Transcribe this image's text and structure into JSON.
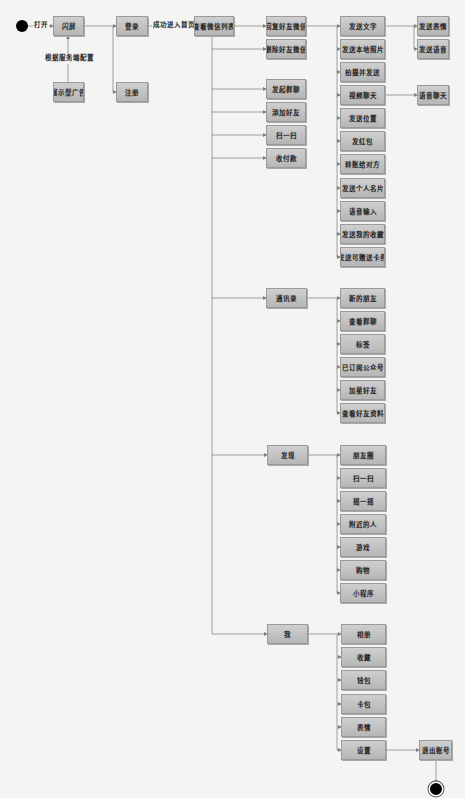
{
  "diagram": {
    "type": "activity-flow",
    "colors": {
      "node_fill_top": "#cfcfcf",
      "node_fill_bottom": "#b6b6b6",
      "node_border": "#9a9a9a",
      "line": "#7f7f7f",
      "background": "#f4f4f2"
    },
    "start": {
      "label": "打开"
    },
    "edge_labels": {
      "server_config": "根据服务端配置",
      "login_success": "成功进入首页"
    },
    "nodes": {
      "splash": "闪屏",
      "ad": "展示型广告",
      "login": "登录",
      "register": "注册",
      "chat_list": "查看微信列表",
      "reply_friend": "回复好友微信",
      "delete_friend": "删除好友微信",
      "group_chat": "发起群聊",
      "add_friend": "添加好友",
      "scan": "扫一扫",
      "payment": "收付款",
      "contacts": "通讯录",
      "discover": "发现",
      "me": "我",
      "logout": "退出账号"
    },
    "reply_actions": [
      "发送文字",
      "发送本地照片",
      "拍摄并发送",
      "视频聊天",
      "发送位置",
      "发红包",
      "转账给对方",
      "发送个人名片",
      "语音输入",
      "发送我的收藏",
      "发送可赠送卡券"
    ],
    "text_sub_actions": [
      "发送表情",
      "发送语音"
    ],
    "video_sub_actions": [
      "语音聊天"
    ],
    "contacts_items": [
      "新的朋友",
      "查看群聊",
      "标签",
      "已订阅公众号",
      "加星好友",
      "查看好友资料"
    ],
    "discover_items": [
      "朋友圈",
      "扫一扫",
      "摇一摇",
      "附近的人",
      "游戏",
      "购物",
      "小程序"
    ],
    "me_items": [
      "相册",
      "收藏",
      "钱包",
      "卡包",
      "表情",
      "设置"
    ]
  }
}
